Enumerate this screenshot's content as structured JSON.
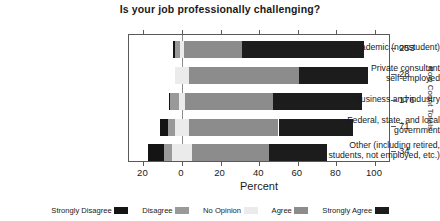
{
  "chart_data": {
    "type": "bar",
    "variant": "diverging-stacked-likert",
    "title": "Is your job professionally challenging?",
    "xlabel": "Percent",
    "ylabel": "",
    "right_axis_label": "Row Count Totals",
    "xlim": [
      -26,
      110
    ],
    "xticks": [
      -20,
      0,
      20,
      40,
      60,
      80,
      100
    ],
    "xticklabels": [
      "20",
      "0",
      "20",
      "40",
      "60",
      "80",
      "100"
    ],
    "grid": false,
    "legend_position": "bottom",
    "zero_reference": 0,
    "categories": [
      "Academic (nonstudent)",
      "Private consultant\nself-employed",
      "Business and industry",
      "Federal, state, and local\ngovernment",
      "Other (including retired,\nstudents, not employed, etc.)"
    ],
    "category_lines": [
      [
        "Academic (nonstudent)"
      ],
      [
        "Private consultant",
        "self-employed"
      ],
      [
        "Business and industry"
      ],
      [
        "Federal, state, and local",
        "government"
      ],
      [
        "Other (including retired,",
        "students, not employed, etc.)"
      ]
    ],
    "series": [
      {
        "name": "Strongly Disagree",
        "color": "#141414",
        "values": [
          1.2,
          0.0,
          0.6,
          4.2,
          8.5
        ]
      },
      {
        "name": "Disagree",
        "color": "#999999",
        "values": [
          2.4,
          0.0,
          4.5,
          3.5,
          4.0
        ]
      },
      {
        "name": "No Opinion",
        "color": "#ebebeb",
        "values": [
          2.4,
          7.1,
          3.4,
          7.0,
          10.3
        ]
      },
      {
        "name": "Agree",
        "color": "#8c8c8c",
        "values": [
          30.0,
          57.1,
          45.5,
          46.5,
          40.0
        ]
      },
      {
        "name": "Strongly Agree",
        "color": "#1c1c1c",
        "values": [
          63.0,
          35.8,
          46.0,
          38.8,
          30.0
        ]
      }
    ],
    "row_count_totals": [
      253,
      28,
      176,
      71,
      34
    ],
    "legend_entries": [
      {
        "label": "Strongly Disagree",
        "color": "#141414"
      },
      {
        "label": "Disagree",
        "color": "#999999"
      },
      {
        "label": "No Opinion",
        "color": "#ebebeb"
      },
      {
        "label": "Agree",
        "color": "#8c8c8c"
      },
      {
        "label": "Strongly Agree",
        "color": "#1c1c1c"
      }
    ]
  },
  "axis": {
    "zero_px": 181,
    "px_per_percent": 1.93,
    "plot_left_px": 128,
    "plot_top_px": 34,
    "row_centers_px": [
      48,
      74,
      100,
      126,
      151
    ]
  }
}
